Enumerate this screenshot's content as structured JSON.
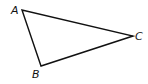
{
  "diagram": {
    "type": "triangle",
    "stroke_color": "#111111",
    "fill_color": "#ffffff",
    "vertices": [
      {
        "label": "A",
        "x": 22,
        "y": 10,
        "label_x": 11,
        "label_y": 14
      },
      {
        "label": "B",
        "x": 41,
        "y": 66,
        "label_x": 32,
        "label_y": 78
      },
      {
        "label": "C",
        "x": 133,
        "y": 36,
        "label_x": 135,
        "label_y": 40
      }
    ]
  }
}
